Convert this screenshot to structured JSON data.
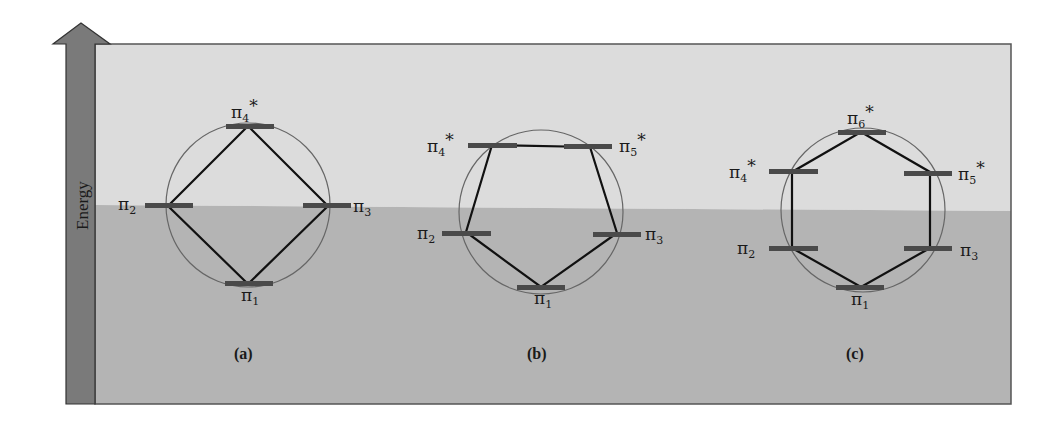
{
  "axis": {
    "label": "Energy"
  },
  "colors": {
    "upper_band": "#dcdcdc",
    "lower_band": "#b4b4b4",
    "arrow": "#7a7a7a",
    "level_bar": "#4a4a4a",
    "polygon": "#111111",
    "circle": "#666666"
  },
  "diagrams": [
    {
      "caption": "(a)",
      "levels": [
        {
          "sym": "π",
          "sub": "4",
          "star": "*"
        },
        {
          "sym": "π",
          "sub": "2",
          "star": ""
        },
        {
          "sym": "π",
          "sub": "3",
          "star": ""
        },
        {
          "sym": "π",
          "sub": "1",
          "star": ""
        }
      ]
    },
    {
      "caption": "(b)",
      "levels": [
        {
          "sym": "π",
          "sub": "4",
          "star": "*"
        },
        {
          "sym": "π",
          "sub": "5",
          "star": "*"
        },
        {
          "sym": "π",
          "sub": "2",
          "star": ""
        },
        {
          "sym": "π",
          "sub": "3",
          "star": ""
        },
        {
          "sym": "π",
          "sub": "1",
          "star": ""
        }
      ]
    },
    {
      "caption": "(c)",
      "levels": [
        {
          "sym": "π",
          "sub": "6",
          "star": "*"
        },
        {
          "sym": "π",
          "sub": "4",
          "star": "*"
        },
        {
          "sym": "π",
          "sub": "5",
          "star": "*"
        },
        {
          "sym": "π",
          "sub": "2",
          "star": ""
        },
        {
          "sym": "π",
          "sub": "3",
          "star": ""
        },
        {
          "sym": "π",
          "sub": "1",
          "star": ""
        }
      ]
    }
  ]
}
